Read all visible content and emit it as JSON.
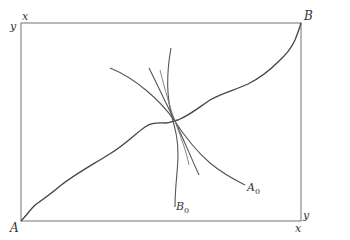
{
  "diagram": {
    "type": "edgeworth-box-contract-curve",
    "colors": {
      "frame": "#8a8a8a",
      "curve": "#444444",
      "indifference": "#555555",
      "text": "#333333"
    },
    "corner_labels": {
      "top_left_x": "x",
      "top_left_y": "y",
      "top_right": "B",
      "bottom_left": "A",
      "bottom_right_y": "y",
      "bottom_right_x": "x"
    },
    "curve_labels": {
      "b0": {
        "letter": "B",
        "subscript": "0"
      },
      "a0": {
        "letter": "A",
        "subscript": "0"
      }
    },
    "elements": [
      "outer box frame",
      "contract curve from A to B",
      "indifference curve B0 (steep)",
      "indifference curve A0",
      "two additional intersecting curves at tangency point"
    ]
  }
}
